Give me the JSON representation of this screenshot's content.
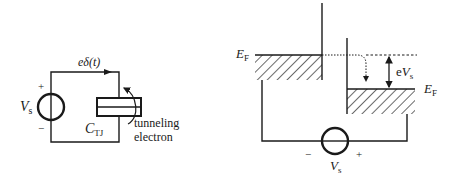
{
  "figure": {
    "type": "single-electron tunneling diagram",
    "colors": {
      "ink": "#1a1a1a",
      "background": "#ffffff"
    }
  },
  "circuit": {
    "source_label_main": "V",
    "source_label_sub": "s",
    "plus_sign": "+",
    "minus_sign": "−",
    "current_label": "eδ(t)",
    "capacitor_label_main": "C",
    "capacitor_label_sub": "TJ",
    "tunneling_label_line1": "tunneling",
    "tunneling_label_line2": "electron"
  },
  "band_diagram": {
    "fermi_left_main": "E",
    "fermi_left_sub": "F",
    "fermi_right_main": "E",
    "fermi_right_sub": "F",
    "bias_label_prefix": "e",
    "bias_label_main": "V",
    "bias_label_sub": "s",
    "source_label_main": "V",
    "source_label_sub": "s",
    "minus_sign": "−",
    "plus_sign": "+"
  }
}
